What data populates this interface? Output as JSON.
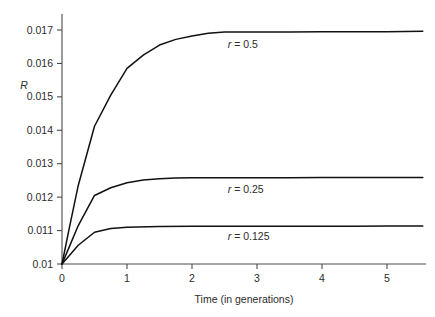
{
  "chart_data": {
    "type": "line",
    "title": "",
    "xlabel": "Time (in generations)",
    "ylabel": "R",
    "xlim": [
      0,
      5.6
    ],
    "ylim": [
      0.01,
      0.01745
    ],
    "grid": false,
    "legend_position": "inline-right-of-curve",
    "xticks": [
      "0",
      "1",
      "2",
      "3",
      "4",
      "5"
    ],
    "xtick_values": [
      0,
      1,
      2,
      3,
      4,
      5
    ],
    "yticks": [
      "0.01",
      "0.011",
      "0.012",
      "0.013",
      "0.014",
      "0.015",
      "0.016",
      "0.017"
    ],
    "ytick_values": [
      0.01,
      0.011,
      0.012,
      0.013,
      0.014,
      0.015,
      0.016,
      0.017
    ],
    "series": [
      {
        "name": "r = 0.5",
        "label_var": "r",
        "label_rest": " = 0.5",
        "plateau": 0.01695,
        "x": [
          0,
          0.12,
          0.25,
          0.5,
          0.75,
          1.0,
          1.25,
          1.5,
          1.75,
          2.0,
          2.25,
          2.5,
          3.0,
          3.5,
          4.0,
          4.5,
          5.0,
          5.55
        ],
        "values": [
          0.01,
          0.01115,
          0.01235,
          0.01412,
          0.01505,
          0.01585,
          0.01625,
          0.01655,
          0.01672,
          0.01682,
          0.0169,
          0.01694,
          0.01694,
          0.01694,
          0.01695,
          0.01695,
          0.01695,
          0.01696
        ]
      },
      {
        "name": "r = 0.25",
        "label_var": "r",
        "label_rest": " = 0.25",
        "plateau": 0.01258,
        "x": [
          0,
          0.12,
          0.25,
          0.5,
          0.75,
          1.0,
          1.25,
          1.5,
          1.75,
          2.0,
          2.5,
          3.0,
          3.5,
          4.0,
          4.5,
          5.0,
          5.55
        ],
        "values": [
          0.01,
          0.01055,
          0.01115,
          0.01205,
          0.01228,
          0.01243,
          0.01251,
          0.01255,
          0.01257,
          0.01258,
          0.01258,
          0.01258,
          0.01258,
          0.01259,
          0.01259,
          0.01259,
          0.01259
        ]
      },
      {
        "name": "r = 0.125",
        "label_var": "r",
        "label_rest": " = 0.125",
        "plateau": 0.01113,
        "x": [
          0,
          0.12,
          0.25,
          0.5,
          0.75,
          1.0,
          1.5,
          2.0,
          2.5,
          3.0,
          3.5,
          4.0,
          4.5,
          5.0,
          5.55
        ],
        "values": [
          0.01,
          0.01027,
          0.01056,
          0.01095,
          0.01106,
          0.0111,
          0.01112,
          0.01113,
          0.01113,
          0.01113,
          0.01113,
          0.01113,
          0.01113,
          0.01114,
          0.01114
        ]
      }
    ],
    "series_label_positions": [
      {
        "x": 2.55,
        "y": 0.01645
      },
      {
        "x": 2.55,
        "y": 0.01212
      },
      {
        "x": 2.55,
        "y": 0.01072
      }
    ]
  },
  "colors": {
    "background": "#ffffff",
    "axis": "#4a4a4a",
    "curve": "#111111",
    "text": "#2b2b2b"
  }
}
